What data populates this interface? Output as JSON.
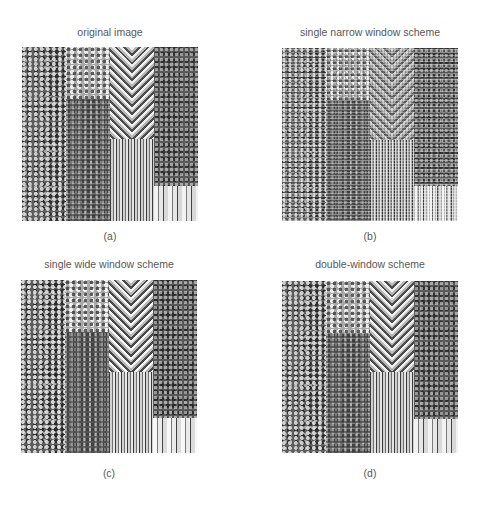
{
  "figure": {
    "background": "#ffffff",
    "text_color": "#575757",
    "panels": [
      {
        "id": "a",
        "title": "original image",
        "label": "(a)",
        "description": "texture mosaic: blotchy, maze-like, herringbone, vertical stripes, mottled and wood-grain textures"
      },
      {
        "id": "b",
        "title": "single narrow window scheme",
        "label": "(b)",
        "description": "reconstruction with grid/blocking artifacts"
      },
      {
        "id": "c",
        "title": "single wide window scheme",
        "label": "(c)",
        "description": "reconstruction with smoothed/blurred details"
      },
      {
        "id": "d",
        "title": "double-window scheme",
        "label": "(d)",
        "description": "reconstruction close to original"
      }
    ]
  }
}
